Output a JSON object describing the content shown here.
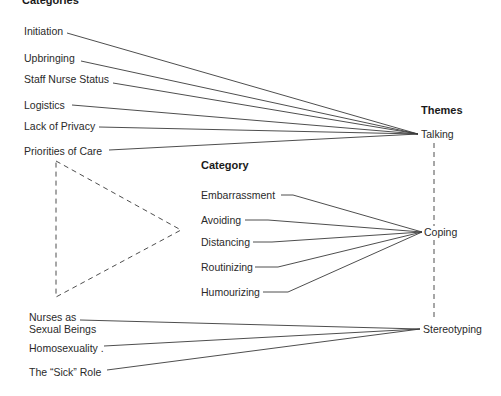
{
  "headings": {
    "categories": "Categories",
    "category": "Category",
    "themes": "Themes"
  },
  "themes": [
    {
      "id": "talking",
      "label": "Talking"
    },
    {
      "id": "coping",
      "label": "Coping"
    },
    {
      "id": "stereotyping",
      "label": "Stereotyping"
    }
  ],
  "talking_categories": [
    {
      "label": "Initiation"
    },
    {
      "label": "Upbringing"
    },
    {
      "label": "Staff Nurse Status"
    },
    {
      "label": "Logistics"
    },
    {
      "label": "Lack of Privacy"
    },
    {
      "label": "Priorities of Care"
    }
  ],
  "coping_categories": [
    {
      "label": "Embarrassment"
    },
    {
      "label": "Avoiding"
    },
    {
      "label": "Distancing"
    },
    {
      "label": "Routinizing"
    },
    {
      "label": "Humourizing"
    }
  ],
  "stereotyping_categories": [
    {
      "label_line1": "Nurses as",
      "label_line2": "Sexual Beings"
    },
    {
      "label": "Homosexuality ."
    },
    {
      "label": "The “Sick” Role"
    }
  ],
  "colors": {
    "line": "#3a3a3a",
    "text": "#2a2a2a",
    "background": "#ffffff"
  }
}
